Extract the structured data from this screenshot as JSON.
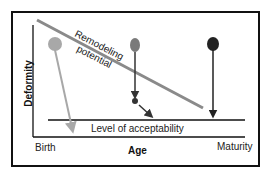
{
  "diagram": {
    "y_axis_label": "Deformity",
    "x_axis_label": "Age",
    "x_start_label": "Birth",
    "x_end_label": "Maturity",
    "threshold_label": "Level of acceptability",
    "trend_label_line1": "Remodeling",
    "trend_label_line2": "potential",
    "colors": {
      "light_pin": "#a8a8a8",
      "medium_pin": "#7a7a7a",
      "dark_pin": "#222222",
      "trend_line": "#8a8a8a",
      "frame": "#111111"
    }
  }
}
